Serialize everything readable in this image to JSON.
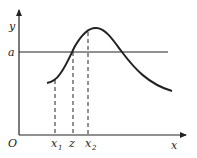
{
  "diagram": {
    "axes": {
      "x_label": "x",
      "y_label": "y",
      "origin_label": "O"
    },
    "horizontal_line": {
      "label": "a"
    },
    "x_markers": [
      {
        "base": "x",
        "sub": "1"
      },
      {
        "base": "z",
        "sub": ""
      },
      {
        "base": "x",
        "sub": "2"
      }
    ],
    "curve": {
      "description": "unimodal curve rising from left, crossing level a, peaking, then decaying to the right"
    },
    "colors": {
      "stroke": "#222222",
      "background": "#ffffff"
    }
  }
}
